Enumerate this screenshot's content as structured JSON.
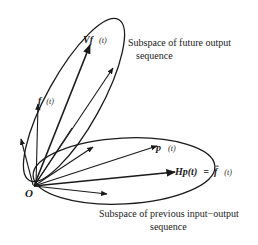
{
  "diagram": {
    "origin_label": "O",
    "subspaces": {
      "future": {
        "caption_line1": "Subspace of future output",
        "caption_line2": "sequence"
      },
      "past": {
        "caption_line1": "Subspace of previous input−output",
        "caption_line2": "sequence"
      }
    },
    "vectors": {
      "vf": {
        "main": "Vf",
        "arg": "(t)"
      },
      "f": {
        "main": "f",
        "arg": "(t)"
      },
      "p": {
        "main": "p",
        "arg": "(t)"
      },
      "hp": {
        "main": "Hp(t)",
        "eq": "=",
        "rhs_symbol": "f̂",
        "arg": "(t)"
      }
    },
    "colors": {
      "ink": "#1a1a1a",
      "background": "#ffffff"
    }
  }
}
